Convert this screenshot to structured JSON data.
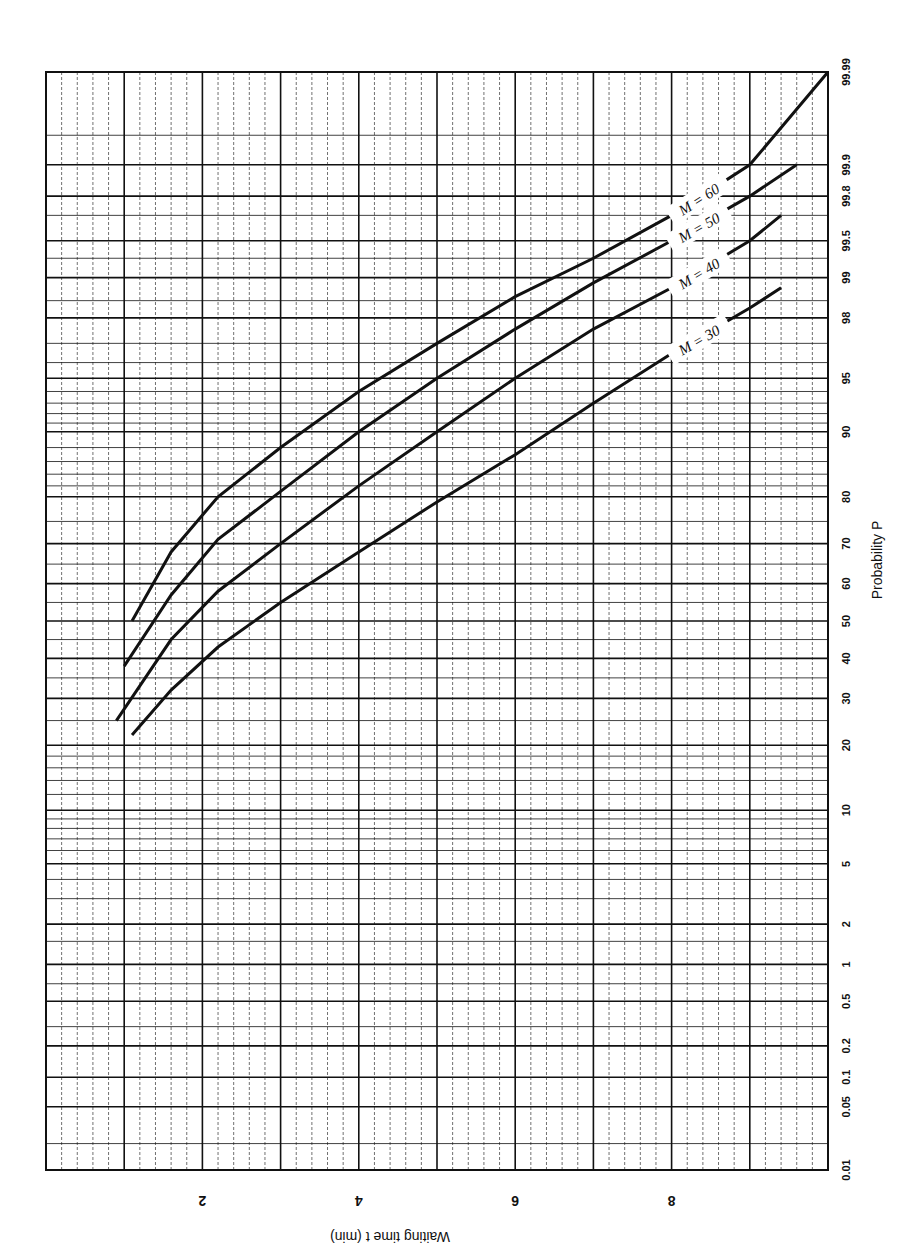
{
  "chart_data": {
    "type": "line",
    "title": "",
    "orientation": "rotated 90° (page landscape, axes labels rotated)",
    "xlabel": "Waiting time t (min)",
    "ylabel": "Probability P",
    "x_ticks": [
      "2",
      "4",
      "6",
      "8"
    ],
    "x_range": [
      0,
      10
    ],
    "y_scale": "normal probability",
    "y_ticks": [
      "0.01",
      "0.05",
      "0.1",
      "0.2",
      "0.5",
      "1",
      "2",
      "5",
      "10",
      "20",
      "30",
      "40",
      "50",
      "60",
      "70",
      "80",
      "90",
      "95",
      "98",
      "99",
      "99.5",
      "99.8",
      "99.9",
      "99.99"
    ],
    "y_range": [
      0.01,
      99.99
    ],
    "grid": true,
    "legend_position": "inline labels near curve ends",
    "series": [
      {
        "name": "M = 60",
        "x": [
          1.1,
          1.6,
          2.2,
          3.0,
          4.0,
          5.0,
          6.0,
          7.0,
          8.0,
          9.0,
          10.0
        ],
        "y": [
          50,
          68,
          80,
          88,
          94,
          97,
          98.6,
          99.3,
          99.7,
          99.9,
          99.99
        ]
      },
      {
        "name": "M = 50",
        "x": [
          1.0,
          1.6,
          2.2,
          3.0,
          4.0,
          5.0,
          6.0,
          7.0,
          8.0,
          9.0,
          9.6
        ],
        "y": [
          38,
          57,
          71,
          81,
          90,
          95,
          97.6,
          98.9,
          99.5,
          99.8,
          99.9
        ]
      },
      {
        "name": "M = 40",
        "x": [
          0.9,
          1.6,
          2.2,
          3.0,
          4.0,
          5.0,
          6.0,
          7.0,
          8.0,
          9.0,
          9.4
        ],
        "y": [
          25,
          45,
          58,
          70,
          82,
          90,
          95,
          97.6,
          98.8,
          99.5,
          99.7
        ]
      },
      {
        "name": "M = 30",
        "x": [
          1.1,
          1.6,
          2.2,
          3.0,
          4.0,
          5.0,
          6.0,
          7.0,
          8.0,
          9.0,
          9.4
        ],
        "y": [
          22,
          32,
          43,
          55,
          68,
          79,
          87,
          93,
          96.5,
          98.3,
          98.8
        ]
      }
    ]
  },
  "labels": {
    "x_axis_title": "Waiting time t (min)",
    "y_axis_title": "Probability P",
    "curves": [
      "M = 60",
      "M = 50",
      "M = 40",
      "M = 30"
    ]
  },
  "colors": {
    "ink": "#111111",
    "paper": "#ffffff"
  }
}
